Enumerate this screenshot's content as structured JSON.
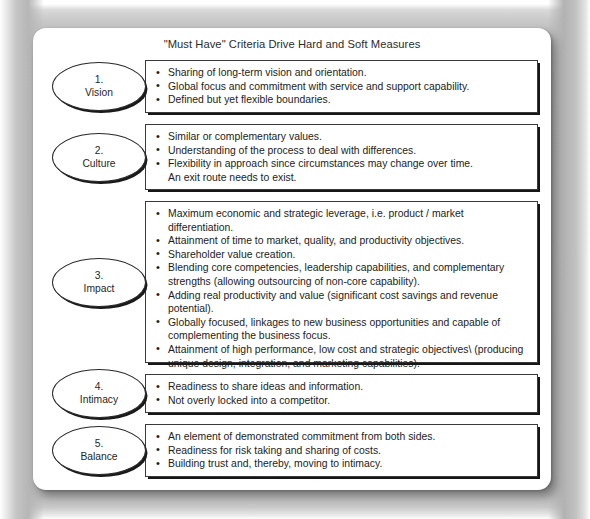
{
  "document": {
    "title": "\"Must Have\" Criteria Drive Hard and Soft Measures"
  },
  "rows": [
    {
      "number": "1.",
      "name": "Vision",
      "bullets": [
        {
          "text": "Sharing of long-term vision and orientation.",
          "bullet": true
        },
        {
          "text": "Global focus and commitment with service and support capability.",
          "bullet": true
        },
        {
          "text": "Defined but yet flexible boundaries.",
          "bullet": true
        }
      ]
    },
    {
      "number": "2.",
      "name": "Culture",
      "bullets": [
        {
          "text": "Similar or complementary values.",
          "bullet": true
        },
        {
          "text": "Understanding of the process to deal with differences.",
          "bullet": true
        },
        {
          "text": "Flexibility in approach since circumstances may change over time.",
          "bullet": true
        },
        {
          "text": "An exit route needs to exist.",
          "bullet": false
        }
      ]
    },
    {
      "number": "3.",
      "name": "Impact",
      "bullets": [
        {
          "text": "Maximum economic and strategic leverage, i.e. product / market differentiation.",
          "bullet": true
        },
        {
          "text": "Attainment of time to market, quality, and productivity objectives.",
          "bullet": true
        },
        {
          "text": "Shareholder value creation.",
          "bullet": true
        },
        {
          "text": "Blending core competencies, leadership capabilities, and complementary strengths (allowing outsourcing of non-core capability).",
          "bullet": true
        },
        {
          "text": "Adding real productivity and value (significant cost savings and revenue potential).",
          "bullet": true
        },
        {
          "text": "Globally focused, linkages to new business opportunities and capable of complementing the business focus.",
          "bullet": true
        },
        {
          "text": "Attainment of high performance, low cost and strategic objectives\\ (producing unique design, integration, and marketing capabilities).",
          "bullet": true
        }
      ]
    },
    {
      "number": "4.",
      "name": "Intimacy",
      "bullets": [
        {
          "text": "Readiness to share ideas and information.",
          "bullet": true
        },
        {
          "text": "Not overly locked into a competitor.",
          "bullet": true
        }
      ]
    },
    {
      "number": "5.",
      "name": "Balance",
      "bullets": [
        {
          "text": "An element of demonstrated commitment from both sides.",
          "bullet": true
        },
        {
          "text": "Readiness for risk taking and sharing of costs.",
          "bullet": true
        },
        {
          "text": "Building trust and, thereby, moving to intimacy.",
          "bullet": true
        }
      ]
    }
  ]
}
